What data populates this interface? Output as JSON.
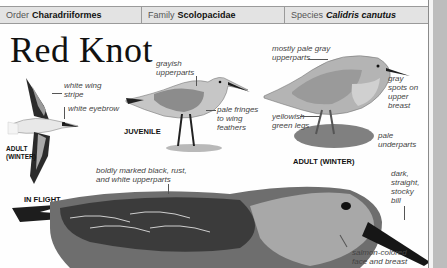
{
  "taxonomy": {
    "order": {
      "key": "Order",
      "value": "Charadriiformes"
    },
    "family": {
      "key": "Family",
      "value": "Scolopacidae"
    },
    "species": {
      "key": "Species",
      "value": "Calidris canutus"
    }
  },
  "title": "Red Knot",
  "figures": {
    "flight": {
      "caption": "IN FLIGHT",
      "sub_caption_line1": "ADULT",
      "sub_caption_line2": "(WINTER)",
      "labels": {
        "wing_stripe_1": "white wing",
        "wing_stripe_2": "stripe",
        "eyebrow": "white eyebrow"
      }
    },
    "juvenile": {
      "caption": "JUVENILE",
      "labels": {
        "upper_1": "grayish",
        "upper_2": "upperparts",
        "fringes_1": "pale fringes",
        "fringes_2": "to wing",
        "fringes_3": "feathers"
      }
    },
    "adult_winter": {
      "caption": "ADULT (WINTER)",
      "labels": {
        "upper_1": "mostly pale gray",
        "upper_2": "upperparts",
        "spots_1": "gray",
        "spots_2": "spots on",
        "spots_3": "upper",
        "spots_4": "breast",
        "legs_1": "yellowish",
        "legs_2": "green legs",
        "under_1": "pale",
        "under_2": "underparts"
      }
    },
    "breeding": {
      "labels": {
        "upper_1": "boldly marked black, rust,",
        "upper_2": "and white upperparts",
        "bill_1": "dark,",
        "bill_2": "straight,",
        "bill_3": "stocky",
        "bill_4": "bill",
        "face_1": "salmon-colored",
        "face_2": "face and breast"
      }
    }
  }
}
